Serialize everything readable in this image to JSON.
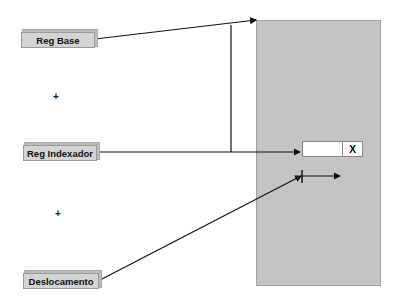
{
  "labels": {
    "base": "Reg Base",
    "index": "Reg Indexador",
    "offset": "Deslocamento"
  },
  "operators": {
    "plus1": "+",
    "plus2": "+"
  },
  "memory": {
    "cell_marker": "X"
  },
  "colors": {
    "panel": "#c4c4c4",
    "label_bg": "#d4d4d4",
    "line": "#111111"
  }
}
